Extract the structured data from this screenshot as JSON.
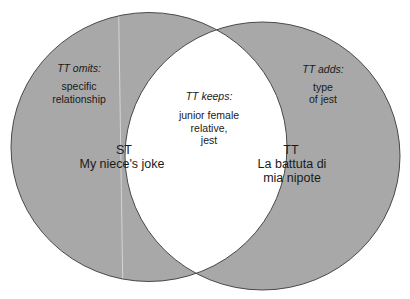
{
  "diagram": {
    "type": "venn",
    "fill_color": "#a8a8a8",
    "overlap_color": "#ffffff",
    "stroke_color": "#3a3a3a",
    "left_set": {
      "code": "ST",
      "name": "My niece's joke",
      "region_heading": "TT omits:",
      "region_lines": [
        "specific",
        "relationship"
      ]
    },
    "right_set": {
      "code": "TT",
      "name_lines": [
        "La battuta di",
        "mia nipote"
      ],
      "region_heading": "TT adds:",
      "region_lines": [
        "type",
        "of jest"
      ]
    },
    "overlap": {
      "heading": "TT keeps:",
      "lines": [
        "junior female",
        "relative,",
        "jest"
      ]
    }
  }
}
